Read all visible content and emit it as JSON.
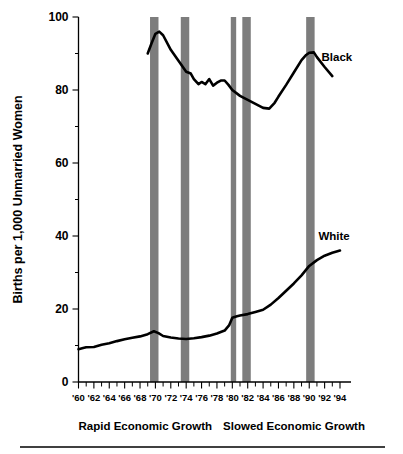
{
  "chart_data": {
    "type": "line",
    "title": "",
    "xlabel": "",
    "ylabel": "Births per 1,000 Unmarried Women",
    "xlim": [
      1960,
      1994
    ],
    "ylim": [
      0,
      100
    ],
    "grid": false,
    "legend_position": "inline-right",
    "y_ticks": [
      0,
      20,
      40,
      60,
      80,
      100
    ],
    "y_tick_labels": [
      "0",
      "20",
      "40",
      "60",
      "80",
      "100"
    ],
    "y_minor_ticks": [
      10,
      30,
      50,
      70,
      90
    ],
    "x_ticks": [
      1960,
      1962,
      1964,
      1966,
      1968,
      1970,
      1972,
      1974,
      1976,
      1978,
      1980,
      1982,
      1984,
      1986,
      1988,
      1990,
      1992,
      1994
    ],
    "x_tick_labels": [
      "'60",
      "'62",
      "'64",
      "'66",
      "'68",
      "'70",
      "'72",
      "'74",
      "'76",
      "'78",
      "'80",
      "'82",
      "'84",
      "'86",
      "'88",
      "'90",
      "'92",
      "'94"
    ],
    "series": [
      {
        "name": "Black",
        "label": "Black",
        "color": "#000000",
        "label_x": 1991.6,
        "label_y": 88.0,
        "x": [
          1969,
          1969.5,
          1970,
          1970.5,
          1971,
          1972,
          1973,
          1974,
          1974.6,
          1975,
          1975.6,
          1976,
          1976.5,
          1977,
          1977.5,
          1978,
          1978.5,
          1979,
          1979.5,
          1980,
          1981,
          1982,
          1983,
          1984,
          1984.8,
          1985.5,
          1986,
          1987,
          1988,
          1989,
          1989.6,
          1990,
          1990.6,
          1991,
          1992,
          1993
        ],
        "y": [
          90.0,
          92.8,
          95.4,
          96.0,
          95.0,
          91.0,
          88.0,
          85.0,
          84.5,
          83.0,
          81.6,
          82.2,
          81.6,
          83.0,
          81.2,
          82.0,
          82.6,
          82.6,
          81.4,
          80.0,
          78.4,
          77.3,
          76.2,
          75.1,
          74.9,
          76.5,
          78.2,
          81.4,
          84.8,
          88.2,
          89.6,
          90.2,
          90.3,
          89.0,
          86.3,
          83.8
        ]
      },
      {
        "name": "White",
        "label": "White",
        "color": "#000000",
        "label_x": 1991.2,
        "label_y": 39.0,
        "x": [
          1960,
          1960.6,
          1961,
          1962,
          1963,
          1964,
          1965,
          1966,
          1967,
          1968,
          1969,
          1969.8,
          1970.4,
          1971,
          1972,
          1973,
          1974,
          1975,
          1976,
          1977,
          1978,
          1979,
          1979.6,
          1980,
          1980.6,
          1981,
          1982,
          1983,
          1984,
          1985,
          1986,
          1987,
          1988,
          1989,
          1990,
          1991,
          1992,
          1993,
          1994
        ],
        "y": [
          9.0,
          9.3,
          9.5,
          9.6,
          10.2,
          10.6,
          11.2,
          11.7,
          12.1,
          12.5,
          13.1,
          13.9,
          13.4,
          12.6,
          12.2,
          11.9,
          11.8,
          12.0,
          12.3,
          12.7,
          13.3,
          14.1,
          15.6,
          17.6,
          18.0,
          18.2,
          18.6,
          19.2,
          19.8,
          21.2,
          23.0,
          25.0,
          27.0,
          29.2,
          31.8,
          33.4,
          34.6,
          35.4,
          36.0
        ]
      }
    ],
    "shaded_bands": [
      {
        "name": "recession-1970",
        "start": 1969.3,
        "end": 1970.4
      },
      {
        "name": "recession-1974",
        "start": 1973.3,
        "end": 1974.4
      },
      {
        "name": "recession-1980",
        "start": 1979.8,
        "end": 1980.5
      },
      {
        "name": "recession-1982",
        "start": 1981.3,
        "end": 1982.4
      },
      {
        "name": "recession-1990",
        "start": 1989.6,
        "end": 1990.7
      }
    ],
    "band_color": "#7d7d7d",
    "annotations": [
      {
        "name": "rapid-growth-note",
        "text": "Rapid Economic Growth",
        "x": 1960.0,
        "y": -18
      },
      {
        "name": "slowed-growth-note",
        "text": "Slowed Economic Growth",
        "x": 1978.8,
        "y": -18
      }
    ]
  }
}
